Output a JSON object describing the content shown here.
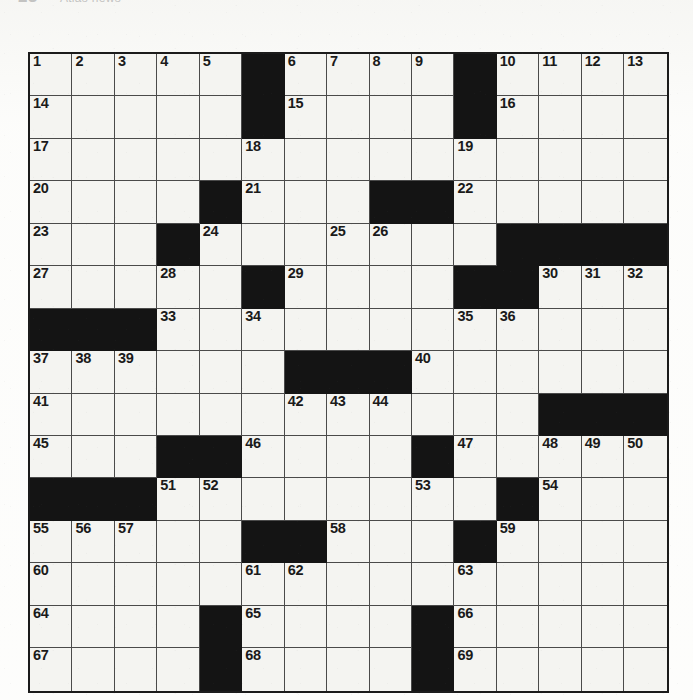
{
  "header": {
    "number": "23",
    "title": "Atlas news",
    "visible": "clipped-top-edge"
  },
  "grid": {
    "rows": 15,
    "cols": 15,
    "cell_size_px": 42.45,
    "colors": {
      "block": "#141414",
      "open": "#f4f4f1",
      "border": "#1b1b1b",
      "grid_line": "#4a4a4a",
      "number": "#1a1a1a"
    },
    "blocks": [
      [
        0,
        5
      ],
      [
        0,
        10
      ],
      [
        1,
        5
      ],
      [
        1,
        10
      ],
      [
        3,
        4
      ],
      [
        3,
        8
      ],
      [
        3,
        9
      ],
      [
        4,
        3
      ],
      [
        4,
        11
      ],
      [
        4,
        12
      ],
      [
        4,
        13
      ],
      [
        4,
        14
      ],
      [
        5,
        5
      ],
      [
        5,
        10
      ],
      [
        5,
        11
      ],
      [
        6,
        0
      ],
      [
        6,
        1
      ],
      [
        6,
        2
      ],
      [
        7,
        6
      ],
      [
        7,
        7
      ],
      [
        7,
        8
      ],
      [
        8,
        12
      ],
      [
        8,
        13
      ],
      [
        8,
        14
      ],
      [
        9,
        3
      ],
      [
        9,
        4
      ],
      [
        9,
        9
      ],
      [
        10,
        0
      ],
      [
        10,
        1
      ],
      [
        10,
        2
      ],
      [
        10,
        11
      ],
      [
        11,
        5
      ],
      [
        11,
        6
      ],
      [
        11,
        10
      ],
      [
        13,
        4
      ],
      [
        13,
        9
      ],
      [
        14,
        4
      ],
      [
        14,
        9
      ]
    ],
    "numbers": [
      {
        "row": 0,
        "col": 0,
        "n": "1"
      },
      {
        "row": 0,
        "col": 1,
        "n": "2"
      },
      {
        "row": 0,
        "col": 2,
        "n": "3"
      },
      {
        "row": 0,
        "col": 3,
        "n": "4"
      },
      {
        "row": 0,
        "col": 4,
        "n": "5"
      },
      {
        "row": 0,
        "col": 6,
        "n": "6"
      },
      {
        "row": 0,
        "col": 7,
        "n": "7"
      },
      {
        "row": 0,
        "col": 8,
        "n": "8"
      },
      {
        "row": 0,
        "col": 9,
        "n": "9"
      },
      {
        "row": 0,
        "col": 11,
        "n": "10"
      },
      {
        "row": 0,
        "col": 12,
        "n": "11"
      },
      {
        "row": 0,
        "col": 13,
        "n": "12"
      },
      {
        "row": 0,
        "col": 14,
        "n": "13"
      },
      {
        "row": 1,
        "col": 0,
        "n": "14"
      },
      {
        "row": 1,
        "col": 6,
        "n": "15"
      },
      {
        "row": 1,
        "col": 11,
        "n": "16"
      },
      {
        "row": 2,
        "col": 0,
        "n": "17"
      },
      {
        "row": 2,
        "col": 5,
        "n": "18"
      },
      {
        "row": 2,
        "col": 10,
        "n": "19"
      },
      {
        "row": 3,
        "col": 0,
        "n": "20"
      },
      {
        "row": 3,
        "col": 5,
        "n": "21"
      },
      {
        "row": 3,
        "col": 10,
        "n": "22"
      },
      {
        "row": 4,
        "col": 0,
        "n": "23"
      },
      {
        "row": 4,
        "col": 4,
        "n": "24"
      },
      {
        "row": 4,
        "col": 7,
        "n": "25"
      },
      {
        "row": 4,
        "col": 8,
        "n": "26"
      },
      {
        "row": 5,
        "col": 0,
        "n": "27"
      },
      {
        "row": 5,
        "col": 3,
        "n": "28"
      },
      {
        "row": 5,
        "col": 6,
        "n": "29"
      },
      {
        "row": 5,
        "col": 12,
        "n": "30"
      },
      {
        "row": 5,
        "col": 13,
        "n": "31"
      },
      {
        "row": 5,
        "col": 14,
        "n": "32"
      },
      {
        "row": 6,
        "col": 3,
        "n": "33"
      },
      {
        "row": 6,
        "col": 5,
        "n": "34"
      },
      {
        "row": 6,
        "col": 10,
        "n": "35"
      },
      {
        "row": 6,
        "col": 11,
        "n": "36"
      },
      {
        "row": 7,
        "col": 0,
        "n": "37"
      },
      {
        "row": 7,
        "col": 1,
        "n": "38"
      },
      {
        "row": 7,
        "col": 2,
        "n": "39"
      },
      {
        "row": 7,
        "col": 9,
        "n": "40"
      },
      {
        "row": 8,
        "col": 0,
        "n": "41"
      },
      {
        "row": 8,
        "col": 6,
        "n": "42"
      },
      {
        "row": 8,
        "col": 7,
        "n": "43"
      },
      {
        "row": 8,
        "col": 8,
        "n": "44"
      },
      {
        "row": 9,
        "col": 0,
        "n": "45"
      },
      {
        "row": 9,
        "col": 5,
        "n": "46"
      },
      {
        "row": 9,
        "col": 10,
        "n": "47"
      },
      {
        "row": 9,
        "col": 12,
        "n": "48"
      },
      {
        "row": 9,
        "col": 13,
        "n": "49"
      },
      {
        "row": 9,
        "col": 14,
        "n": "50"
      },
      {
        "row": 10,
        "col": 3,
        "n": "51"
      },
      {
        "row": 10,
        "col": 4,
        "n": "52"
      },
      {
        "row": 10,
        "col": 9,
        "n": "53"
      },
      {
        "row": 10,
        "col": 12,
        "n": "54"
      },
      {
        "row": 11,
        "col": 0,
        "n": "55"
      },
      {
        "row": 11,
        "col": 1,
        "n": "56"
      },
      {
        "row": 11,
        "col": 2,
        "n": "57"
      },
      {
        "row": 11,
        "col": 7,
        "n": "58"
      },
      {
        "row": 11,
        "col": 11,
        "n": "59"
      },
      {
        "row": 12,
        "col": 0,
        "n": "60"
      },
      {
        "row": 12,
        "col": 5,
        "n": "61"
      },
      {
        "row": 12,
        "col": 6,
        "n": "62"
      },
      {
        "row": 12,
        "col": 10,
        "n": "63"
      },
      {
        "row": 13,
        "col": 0,
        "n": "64"
      },
      {
        "row": 13,
        "col": 5,
        "n": "65"
      },
      {
        "row": 13,
        "col": 10,
        "n": "66"
      },
      {
        "row": 14,
        "col": 0,
        "n": "67"
      },
      {
        "row": 14,
        "col": 5,
        "n": "68"
      },
      {
        "row": 14,
        "col": 10,
        "n": "69"
      }
    ]
  }
}
